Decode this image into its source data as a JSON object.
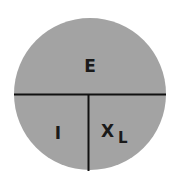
{
  "diagram": {
    "type": "ohms-law-circle",
    "colors": {
      "fill": "#a3a3a3",
      "line": "#111111",
      "background": "#ffffff",
      "text": "#1a1a1a"
    },
    "sections": {
      "top": {
        "label": "E"
      },
      "bottom_left": {
        "label": "I"
      },
      "bottom_right": {
        "label": "X",
        "subscript": "L"
      }
    }
  }
}
